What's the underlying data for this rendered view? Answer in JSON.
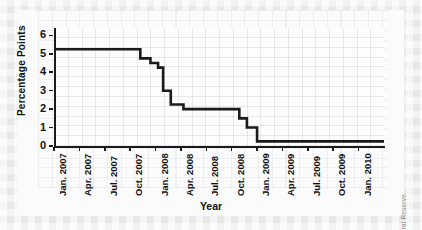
{
  "chart_data": {
    "type": "line",
    "line_style": "step-post",
    "title": "",
    "xlabel": "Year",
    "ylabel": "Percentage Points",
    "ylim": [
      0,
      6.4
    ],
    "yticks": [
      0,
      1,
      2,
      3,
      4,
      5,
      6
    ],
    "ytick_labels": [
      "0",
      "1",
      "2",
      "3",
      "4",
      "5",
      "6"
    ],
    "grid": true,
    "legend": null,
    "source_note": "SOURCE: Federal Reserve",
    "xtick_labels": [
      "Jan. 2007",
      "Apr. 2007",
      "Jul. 2007",
      "Oct. 2007",
      "Jan. 2008",
      "Apr. 2008",
      "Jul. 2008",
      "Oct. 2008",
      "Jan. 2009",
      "Apr. 2009",
      "Jul. 2009",
      "Oct. 2009",
      "Jan. 2010"
    ],
    "x_index_range": [
      0,
      13
    ],
    "series": [
      {
        "name": "Federal funds target rate",
        "color": "#1a1a1a",
        "x": [
          0.0,
          2.9,
          3.4,
          3.8,
          4.1,
          4.3,
          4.6,
          5.1,
          6.6,
          7.3,
          7.6,
          8.0,
          13.0
        ],
        "values": [
          5.25,
          5.25,
          4.75,
          4.5,
          4.25,
          3.0,
          2.25,
          2.0,
          2.0,
          1.5,
          1.0,
          0.25,
          0.25
        ],
        "steps": [
          {
            "x_label": "Jan. 2007",
            "value": 5.25
          },
          {
            "x_label": "Sep. 2007",
            "value": 4.75
          },
          {
            "x_label": "Oct. 2007",
            "value": 4.5
          },
          {
            "x_label": "Dec. 2007",
            "value": 4.25
          },
          {
            "x_label": "Jan. 2008",
            "value": 3.0
          },
          {
            "x_label": "Mar. 2008",
            "value": 2.25
          },
          {
            "x_label": "Apr. 2008",
            "value": 2.0
          },
          {
            "x_label": "Oct. 2008",
            "value": 1.5
          },
          {
            "x_label": "Oct. 2008",
            "value": 1.0
          },
          {
            "x_label": "Dec. 2008",
            "value": 0.25
          },
          {
            "x_label": "Jan. 2010",
            "value": 0.25
          }
        ]
      }
    ]
  }
}
